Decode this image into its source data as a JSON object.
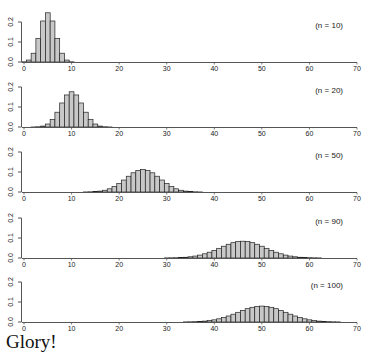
{
  "caption": "Glory!",
  "chart_data": [
    {
      "type": "bar",
      "title": "",
      "annotation": "(n = 10)",
      "xlabel": "",
      "ylabel": "",
      "xlim": [
        0,
        70
      ],
      "ylim": [
        0,
        0.2
      ],
      "xticks": [
        0,
        10,
        20,
        30,
        40,
        50,
        60,
        70
      ],
      "yticks": [
        "0.0",
        "0.1",
        "0.2"
      ],
      "grid": false,
      "x_start": 0,
      "values": [
        0.001,
        0.0098,
        0.0439,
        0.1172,
        0.2051,
        0.2461,
        0.2051,
        0.1172,
        0.0439,
        0.0098,
        0.001
      ]
    },
    {
      "type": "bar",
      "title": "",
      "annotation": "(n = 20)",
      "xlabel": "",
      "ylabel": "",
      "xlim": [
        0,
        70
      ],
      "ylim": [
        0,
        0.2
      ],
      "xticks": [
        0,
        10,
        20,
        30,
        40,
        50,
        60,
        70
      ],
      "yticks": [
        "0.0",
        "0.1",
        "0.2"
      ],
      "grid": false,
      "x_start": 0,
      "values": [
        0.0,
        0.0,
        0.0002,
        0.0011,
        0.0046,
        0.0148,
        0.037,
        0.0739,
        0.1201,
        0.1602,
        0.1762,
        0.1602,
        0.1201,
        0.0739,
        0.037,
        0.0148,
        0.0046,
        0.0011,
        0.0002,
        0.0,
        0.0
      ]
    },
    {
      "type": "bar",
      "title": "",
      "annotation": "(n = 50)",
      "xlabel": "",
      "ylabel": "",
      "xlim": [
        0,
        70
      ],
      "ylim": [
        0,
        0.2
      ],
      "xticks": [
        0,
        10,
        20,
        30,
        40,
        50,
        60,
        70
      ],
      "yticks": [
        "0.0",
        "0.1",
        "0.2"
      ],
      "grid": false,
      "x_start": 13,
      "values": [
        0.0003,
        0.0009,
        0.002,
        0.0044,
        0.0087,
        0.016,
        0.027,
        0.0419,
        0.0598,
        0.0788,
        0.096,
        0.108,
        0.1123,
        0.108,
        0.096,
        0.0788,
        0.0598,
        0.0419,
        0.027,
        0.016,
        0.0087,
        0.0044,
        0.002,
        0.0009,
        0.0003
      ]
    },
    {
      "type": "bar",
      "title": "",
      "annotation": "(n = 90)",
      "xlabel": "",
      "ylabel": "",
      "xlim": [
        0,
        70
      ],
      "ylim": [
        0,
        0.2
      ],
      "xticks": [
        0,
        10,
        20,
        30,
        40,
        50,
        60,
        70
      ],
      "yticks": [
        "0.0",
        "0.1",
        "0.2"
      ],
      "grid": false,
      "x_start": 30,
      "values": [
        0.0005,
        0.0009,
        0.0013,
        0.0021,
        0.0037,
        0.0061,
        0.0097,
        0.0145,
        0.021,
        0.0289,
        0.0382,
        0.0484,
        0.0589,
        0.0687,
        0.0766,
        0.0821,
        0.0839,
        0.0821,
        0.0766,
        0.0687,
        0.0589,
        0.0484,
        0.0382,
        0.0289,
        0.021,
        0.0145,
        0.0097,
        0.0061,
        0.0037,
        0.0021,
        0.0013,
        0.0009,
        0.0005
      ]
    },
    {
      "type": "bar",
      "title": "",
      "annotation": "(n = 100)",
      "xlabel": "",
      "ylabel": "",
      "xlim": [
        0,
        70
      ],
      "ylim": [
        0,
        0.2
      ],
      "xticks": [
        0,
        10,
        20,
        30,
        40,
        50,
        60,
        70
      ],
      "yticks": [
        "0.0",
        "0.1",
        "0.2"
      ],
      "grid": false,
      "x_start": 34,
      "values": [
        0.0005,
        0.0009,
        0.0016,
        0.0027,
        0.0045,
        0.0071,
        0.0108,
        0.0159,
        0.0223,
        0.0301,
        0.039,
        0.0485,
        0.058,
        0.0666,
        0.0735,
        0.078,
        0.0796,
        0.078,
        0.0735,
        0.0666,
        0.058,
        0.0485,
        0.039,
        0.0301,
        0.0223,
        0.0159,
        0.0108,
        0.0071,
        0.0045,
        0.0027,
        0.0016,
        0.0009,
        0.0005
      ]
    }
  ],
  "style": {
    "bar_fill": "#c8c8c8",
    "bar_stroke": "#222222",
    "axis_color": "#555555",
    "text_color": "#222222"
  }
}
